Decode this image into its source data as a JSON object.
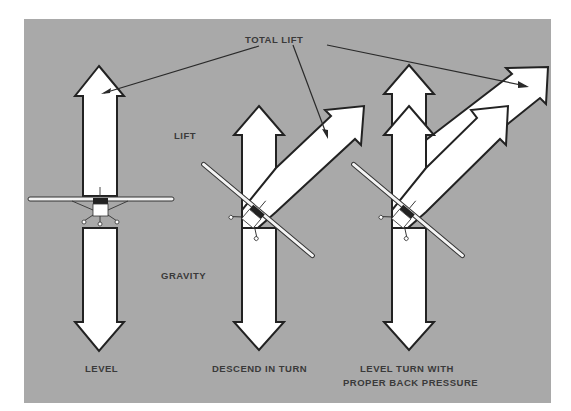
{
  "diagram": {
    "colors": {
      "background": "#a9a9a9",
      "arrow_fill": "#ffffff",
      "arrow_stroke": "#222222",
      "text": "#3a3a3a"
    },
    "labels": {
      "total_lift": "TOTAL LIFT",
      "lift": "LIFT",
      "gravity": "GRAVITY"
    },
    "panels": [
      {
        "id": "level",
        "caption_line1": "LEVEL",
        "caption_line2": ""
      },
      {
        "id": "descend-in-turn",
        "caption_line1": "DESCEND IN TURN",
        "caption_line2": ""
      },
      {
        "id": "level-turn",
        "caption_line1": "LEVEL TURN WITH",
        "caption_line2": "PROPER BACK PRESSURE"
      }
    ]
  }
}
